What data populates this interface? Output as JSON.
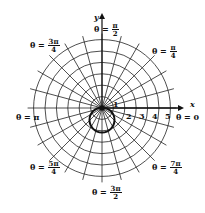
{
  "chart_data": {
    "type": "polar",
    "title": "",
    "curve": {
      "equation_shape": "circle below origin through pole",
      "diameter": 2,
      "center": [
        0,
        -1
      ]
    },
    "radial_ticks": [
      "1",
      "2",
      "3",
      "4",
      "5"
    ],
    "num_circles": 6,
    "num_rays": 24,
    "axes": {
      "x_label": "x",
      "y_label": "y"
    },
    "angle_labels": [
      {
        "id": "theta0",
        "prefix": "θ = ",
        "value": "0"
      },
      {
        "id": "theta_pi4",
        "prefix": "θ = ",
        "num": "π",
        "den": "4"
      },
      {
        "id": "theta_pi2",
        "prefix": "θ = ",
        "num": "π",
        "den": "2"
      },
      {
        "id": "theta_3pi4",
        "prefix": "θ = ",
        "num": "3π",
        "den": "4"
      },
      {
        "id": "theta_pi",
        "prefix": "θ = ",
        "value": "π"
      },
      {
        "id": "theta_5pi4",
        "prefix": "θ = ",
        "num": "5π",
        "den": "4"
      },
      {
        "id": "theta_3pi2",
        "prefix": "θ = ",
        "num": "3π",
        "den": "2"
      },
      {
        "id": "theta_7pi4",
        "prefix": "θ = ",
        "num": "7π",
        "den": "4"
      }
    ]
  }
}
